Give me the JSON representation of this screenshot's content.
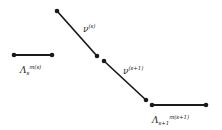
{
  "figure": {
    "background_color": "#ffffff",
    "ink_color": "#1a1a1a",
    "width": 222,
    "height": 130,
    "labels": {
      "lambda_s": {
        "base": "Λ",
        "subscript": "s",
        "superscript": "m(s)",
        "full": "Λ_s^{m(s)}"
      },
      "lambda_s_plus_1": {
        "base": "Λ",
        "subscript": "s+1",
        "superscript": "m(s+1)",
        "full": "Λ_{s+1}^{m(s+1)}"
      },
      "nu_s": {
        "base": "ν",
        "superscript": "(s)",
        "full": "ν^{(s)}"
      },
      "nu_s_plus_1": {
        "base": "ν",
        "superscript": "(s+1)",
        "full": "ν^{(s+1)}"
      }
    },
    "segments": [
      {
        "name": "lambda-s-segment",
        "kind": "horizontal",
        "x1": 14,
        "y1": 55,
        "x2": 52,
        "y2": 55,
        "stroke_width": 1.8,
        "dot_radius": 2.3,
        "label": "lambda_s"
      },
      {
        "name": "nu-s-segment",
        "kind": "diagonal",
        "x1": 57,
        "y1": 11,
        "x2": 97,
        "y2": 56,
        "stroke_width": 1.7,
        "dot_radius": 2.3,
        "label": "nu_s"
      },
      {
        "name": "nu-s-plus-1-segment",
        "kind": "diagonal",
        "x1": 104,
        "y1": 61,
        "x2": 146,
        "y2": 100,
        "stroke_width": 1.7,
        "dot_radius": 2.3,
        "label": "nu_s_plus_1"
      },
      {
        "name": "lambda-s-plus-1-segment",
        "kind": "horizontal",
        "x1": 152,
        "y1": 105,
        "x2": 206,
        "y2": 105,
        "stroke_width": 1.8,
        "dot_radius": 2.3,
        "label": "lambda_s_plus_1"
      }
    ]
  }
}
